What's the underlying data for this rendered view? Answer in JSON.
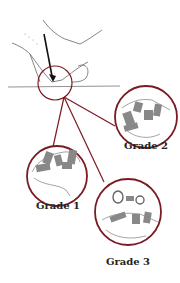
{
  "diagram": {
    "colors": {
      "circle": "#7a1a22",
      "sketch": "#555555",
      "arrow": "#111111",
      "background": "#ffffff"
    },
    "labels": [
      {
        "id": "grade1",
        "text": "Grade 1"
      },
      {
        "id": "grade2",
        "text": "Grade 2"
      },
      {
        "id": "grade3",
        "text": "Grade 3"
      }
    ]
  }
}
